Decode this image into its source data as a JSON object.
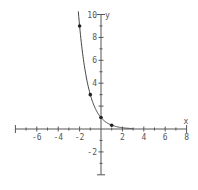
{
  "chart_data": {
    "type": "line",
    "title": "",
    "function": "y = (1/3)^x",
    "xlabel": "x",
    "ylabel": "y",
    "xlim": [
      -8,
      8
    ],
    "ylim": [
      -4,
      10
    ],
    "x_ticks": [
      -6,
      -4,
      -2,
      2,
      4,
      6,
      8
    ],
    "y_ticks": [
      -2,
      4,
      6,
      8,
      10
    ],
    "grid": false,
    "legend": null,
    "series": [
      {
        "name": "curve",
        "x": [
          -2.1,
          -2,
          -1.5,
          -1,
          -0.5,
          0,
          0.5,
          1,
          1.5,
          2,
          2.5,
          3
        ],
        "values": [
          10.05,
          9,
          5.2,
          3,
          1.73,
          1,
          0.58,
          0.333,
          0.19,
          0.111,
          0.064,
          0.037
        ]
      }
    ],
    "points": [
      {
        "x": -2,
        "y": 9
      },
      {
        "x": -1,
        "y": 3
      },
      {
        "x": 0,
        "y": 1
      },
      {
        "x": 1,
        "y": 0.333
      }
    ],
    "colors": {
      "axis": "#555555",
      "curve": "#444444",
      "point": "#222222"
    }
  }
}
